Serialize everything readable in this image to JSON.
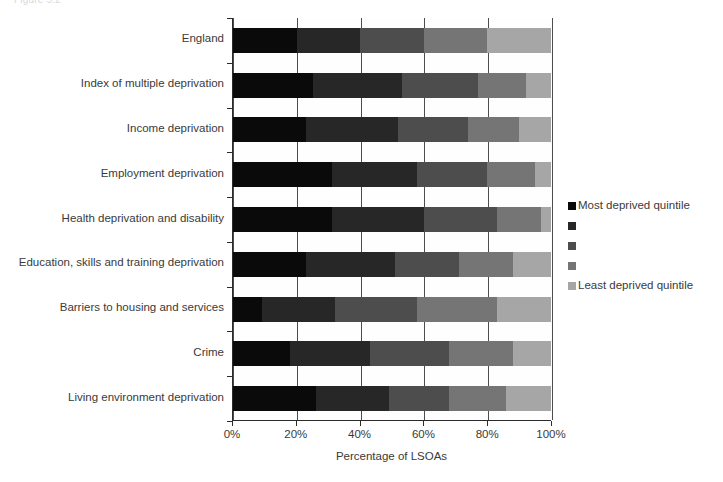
{
  "clipped_title": "Figure 5.2",
  "chart_data": {
    "type": "bar",
    "orientation": "horizontal",
    "stacked": true,
    "stack_mode": "percent",
    "title": "",
    "subtitle": "",
    "xlabel": "Percentage of LSOAs",
    "ylabel": "",
    "xlim": [
      0,
      100
    ],
    "xticks": [
      0,
      20,
      40,
      60,
      80,
      100
    ],
    "xtick_labels": [
      "0%",
      "20%",
      "40%",
      "60%",
      "80%",
      "100%"
    ],
    "grid": true,
    "grid_axis": "x",
    "legend_position": "right",
    "categories": [
      "England",
      "Index of multiple deprivation",
      "Income deprivation",
      "Employment deprivation",
      "Health deprivation and disability",
      "Education, skills and training deprivation",
      "Barriers to housing and services",
      "Crime",
      "Living environment deprivation"
    ],
    "series": [
      {
        "name": "Most deprived quintile",
        "color": "#0a0a0a",
        "values": [
          20,
          25,
          23,
          31,
          31,
          23,
          9,
          18,
          26
        ]
      },
      {
        "name": "",
        "color": "#272727",
        "values": [
          20,
          28,
          29,
          27,
          29,
          28,
          23,
          25,
          23
        ]
      },
      {
        "name": "",
        "color": "#4d4d4d",
        "values": [
          20,
          24,
          22,
          22,
          23,
          20,
          26,
          25,
          19
        ]
      },
      {
        "name": "",
        "color": "#757575",
        "values": [
          20,
          15,
          16,
          15,
          14,
          17,
          25,
          20,
          18
        ]
      },
      {
        "name": "Least deprived quintile",
        "color": "#a6a6a6",
        "values": [
          20,
          8,
          10,
          5,
          3,
          12,
          17,
          12,
          14
        ]
      }
    ],
    "legend_entries": [
      {
        "label": "Most deprived quintile",
        "color": "#0a0a0a"
      },
      {
        "label": "",
        "color": "#272727"
      },
      {
        "label": "",
        "color": "#4d4d4d"
      },
      {
        "label": "",
        "color": "#757575"
      },
      {
        "label": "Least deprived quintile",
        "color": "#a6a6a6"
      }
    ],
    "axis_color": "#2b2b2b",
    "text_color": "#3a3a3a",
    "background_color": "#ffffff"
  }
}
